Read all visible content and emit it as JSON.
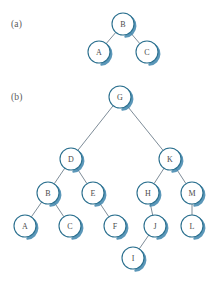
{
  "figure": {
    "type": "binary-tree-diagram",
    "panels": [
      {
        "id": "a",
        "label": "(a)",
        "label_pos": {
          "x": 11,
          "y": 27
        },
        "root": "B",
        "nodes": [
          {
            "id": "B",
            "label": "B",
            "cx": 123,
            "cy": 24,
            "r": 11
          },
          {
            "id": "A",
            "label": "A",
            "cx": 99,
            "cy": 52,
            "r": 11
          },
          {
            "id": "C",
            "label": "C",
            "cx": 147,
            "cy": 52,
            "r": 11
          }
        ],
        "edges": [
          {
            "from": "B",
            "to": "A"
          },
          {
            "from": "B",
            "to": "C"
          }
        ]
      },
      {
        "id": "b",
        "label": "(b)",
        "label_pos": {
          "x": 11,
          "y": 100
        },
        "root": "G",
        "nodes": [
          {
            "id": "G",
            "label": "G",
            "cx": 120,
            "cy": 97,
            "r": 11
          },
          {
            "id": "D",
            "label": "D",
            "cx": 71,
            "cy": 159,
            "r": 11
          },
          {
            "id": "K",
            "label": "K",
            "cx": 170,
            "cy": 159,
            "r": 11
          },
          {
            "id": "B",
            "label": "B",
            "cx": 48,
            "cy": 193,
            "r": 11
          },
          {
            "id": "E",
            "label": "E",
            "cx": 93,
            "cy": 193,
            "r": 11
          },
          {
            "id": "H",
            "label": "H",
            "cx": 148,
            "cy": 193,
            "r": 11
          },
          {
            "id": "M",
            "label": "M",
            "cx": 192,
            "cy": 193,
            "r": 11
          },
          {
            "id": "A",
            "label": "A",
            "cx": 25,
            "cy": 226,
            "r": 11
          },
          {
            "id": "C",
            "label": "C",
            "cx": 70,
            "cy": 226,
            "r": 11
          },
          {
            "id": "F",
            "label": "F",
            "cx": 115,
            "cy": 226,
            "r": 11
          },
          {
            "id": "J",
            "label": "J",
            "cx": 155,
            "cy": 226,
            "r": 11
          },
          {
            "id": "L",
            "label": "L",
            "cx": 192,
            "cy": 226,
            "r": 11
          },
          {
            "id": "I",
            "label": "I",
            "cx": 133,
            "cy": 258,
            "r": 11
          }
        ],
        "edges": [
          {
            "from": "G",
            "to": "D"
          },
          {
            "from": "G",
            "to": "K"
          },
          {
            "from": "D",
            "to": "B"
          },
          {
            "from": "D",
            "to": "E"
          },
          {
            "from": "B",
            "to": "A"
          },
          {
            "from": "B",
            "to": "C"
          },
          {
            "from": "E",
            "to": "F"
          },
          {
            "from": "K",
            "to": "H"
          },
          {
            "from": "K",
            "to": "M"
          },
          {
            "from": "H",
            "to": "J"
          },
          {
            "from": "M",
            "to": "L"
          },
          {
            "from": "J",
            "to": "I"
          }
        ]
      }
    ],
    "colors": {
      "node_stroke": "#2a6f8e",
      "node_fill": "#ffffff",
      "node_shadow": "#3f86ad",
      "edge_stroke": "#5d6f7d",
      "label_text": "#4a4a4a",
      "panel_label_text": "#5a5a5a",
      "background": "#ffffff"
    }
  }
}
